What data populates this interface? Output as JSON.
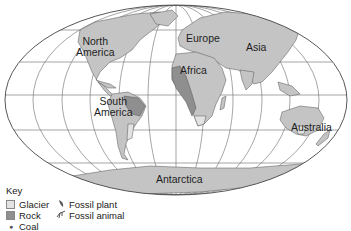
{
  "map": {
    "projection": "oval world map",
    "labels": {
      "north_america": [
        "North",
        "America"
      ],
      "south_america": [
        "South",
        "America"
      ],
      "europe": "Europe",
      "africa": "Africa",
      "asia": "Asia",
      "australia": "Australia",
      "antarctica": "Antarctica"
    },
    "colors": {
      "land": "#c4c4c4",
      "rock": "#8f8f8f",
      "glacier": "#e3e3e3",
      "grid": "#6a6a6a",
      "coastline": "#555555"
    }
  },
  "key": {
    "title": "Key",
    "items": [
      {
        "symbol": "glacier-swatch",
        "label": "Glacier"
      },
      {
        "symbol": "rock-swatch",
        "label": "Rock"
      },
      {
        "symbol": "coal-dot",
        "label": "Coal"
      },
      {
        "symbol": "fossil-plant-icon",
        "label": "Fossil plant"
      },
      {
        "symbol": "fossil-animal-icon",
        "label": "Fossil animal"
      }
    ]
  }
}
